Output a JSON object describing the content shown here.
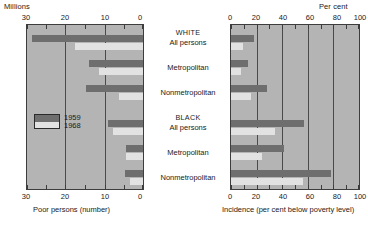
{
  "chart_data": {
    "type": "bar",
    "orientation": "horizontal",
    "title": "",
    "layout": "paired back-to-back panels sharing centred category labels",
    "series_names": [
      "1959",
      "1968"
    ],
    "series_colors": {
      "1959": "#6e6e6e",
      "1968": "#e2e2e2"
    },
    "legend": {
      "position": "inside-left-panel",
      "entries": [
        "1959",
        "1968"
      ]
    },
    "groups": [
      {
        "name": "WHITE",
        "categories": [
          "All persons",
          "Metropolitan",
          "Nonmetropolitan"
        ]
      },
      {
        "name": "BLACK",
        "categories": [
          "All persons",
          "Metropolitan",
          "Nonmetropolitan"
        ]
      }
    ],
    "panels": [
      {
        "id": "poor-persons",
        "unit_label": "Millions",
        "xlabel": "Poor persons (number)",
        "xlim": [
          30,
          0
        ],
        "reversed": true,
        "ticks": [
          30,
          20,
          10,
          0
        ],
        "tick_labels": [
          "30",
          "20",
          "10",
          "0"
        ],
        "minor_ticks": [
          25,
          15,
          5
        ],
        "grid": true,
        "categories": [
          "WHITE All persons",
          "WHITE Metropolitan",
          "WHITE Nonmetropolitan",
          "BLACK All persons",
          "BLACK Metropolitan",
          "BLACK Nonmetropolitan"
        ],
        "series": [
          {
            "name": "1959",
            "values": [
              28.3,
              13.8,
              14.4,
              9.0,
              4.4,
              4.7
            ]
          },
          {
            "name": "1968",
            "values": [
              17.4,
              11.2,
              6.2,
              7.6,
              4.3,
              3.3
            ]
          }
        ]
      },
      {
        "id": "incidence",
        "unit_label": "Per cent",
        "xlabel": "Incidence (per cent below poverty level)",
        "xlim": [
          0,
          100
        ],
        "reversed": false,
        "ticks": [
          0,
          20,
          40,
          60,
          80,
          100
        ],
        "tick_labels": [
          "0",
          "20",
          "40",
          "60",
          "80",
          "100"
        ],
        "minor_ticks": [
          10,
          30,
          50,
          70,
          90
        ],
        "grid": true,
        "categories": [
          "WHITE All persons",
          "WHITE Metropolitan",
          "WHITE Nonmetropolitan",
          "BLACK All persons",
          "BLACK Metropolitan",
          "BLACK Nonmetropolitan"
        ],
        "series": [
          {
            "name": "1959",
            "values": [
              18,
              13,
              28,
              56,
              41,
              77
            ]
          },
          {
            "name": "1968",
            "values": [
              9,
              8,
              15,
              34,
              24,
              55
            ]
          }
        ]
      }
    ]
  },
  "left_panel": {
    "unit": "Millions",
    "axis_title": "Poor persons (number)",
    "tick_30": "30",
    "tick_20": "20",
    "tick_10": "10",
    "tick_0": "0",
    "btick_30": "30",
    "btick_20": "20",
    "btick_10": "10",
    "btick_0": "0"
  },
  "right_panel": {
    "unit": "Per cent",
    "axis_title": "Incidence (per cent below poverty level)",
    "tick_0": "0",
    "tick_20": "20",
    "tick_40": "40",
    "tick_60": "60",
    "tick_80": "80",
    "tick_100": "100",
    "btick_0": "0",
    "btick_20": "20",
    "btick_40": "40",
    "btick_60": "60",
    "btick_80": "80",
    "btick_100": "100"
  },
  "center_labels": {
    "white_header": "WHITE",
    "white_all": "All persons",
    "white_metro": "Metropolitan",
    "white_nonmetro": "Nonmetropolitan",
    "black_header": "BLACK",
    "black_all": "All persons",
    "black_metro": "Metropolitan",
    "black_nonmetro": "Nonmetropolitan"
  },
  "legend": {
    "first": "1959",
    "second": "1968"
  }
}
